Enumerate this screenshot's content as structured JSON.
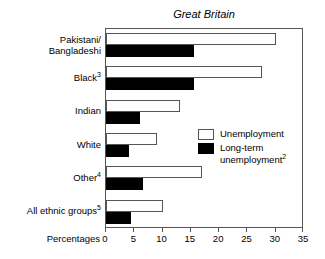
{
  "chart_data": {
    "type": "bar",
    "orientation": "horizontal",
    "title": "Great Britain",
    "xlabel": "Percentages",
    "ylabel": "",
    "xlim": [
      0,
      35
    ],
    "xticks": [
      0,
      5,
      10,
      15,
      20,
      25,
      30,
      35
    ],
    "grid": false,
    "legend_position": "middle-right",
    "categories": [
      "Pakistani/ Bangladeshi",
      "Black3",
      "Indian",
      "White",
      "Other4",
      "All ethnic groups5"
    ],
    "category_labels": [
      {
        "line1": "Pakistani/",
        "line2": "Bangladeshi",
        "sup": ""
      },
      {
        "line1": "Black",
        "line2": "",
        "sup": "3"
      },
      {
        "line1": "Indian",
        "line2": "",
        "sup": ""
      },
      {
        "line1": "White",
        "line2": "",
        "sup": ""
      },
      {
        "line1": "Other",
        "line2": "",
        "sup": "4"
      },
      {
        "line1": "All ethnic groups",
        "line2": "",
        "sup": "5"
      }
    ],
    "series": [
      {
        "name": "Unemployment",
        "color": "#ffffff",
        "values": [
          30.0,
          27.5,
          13.0,
          9.0,
          17.0,
          10.0
        ]
      },
      {
        "name": "Long-term unemployment",
        "name_sup": "2",
        "color": "#000000",
        "values": [
          15.5,
          15.5,
          6.0,
          4.0,
          6.5,
          4.5
        ]
      }
    ]
  },
  "legend": {
    "entries": [
      {
        "label": "Unemployment",
        "sup": "",
        "swatch": "white"
      },
      {
        "label": "Long-term unemployment",
        "sup": "2",
        "swatch": "black"
      }
    ]
  },
  "axis": {
    "x_title": "Percentages",
    "tick_labels": [
      "0",
      "5",
      "10",
      "15",
      "20",
      "25",
      "30",
      "35"
    ]
  },
  "colors": {
    "unemployment_fill": "#ffffff",
    "longterm_fill": "#000000",
    "frame_stroke": "#555555",
    "text": "#000000",
    "background": "#ffffff"
  }
}
